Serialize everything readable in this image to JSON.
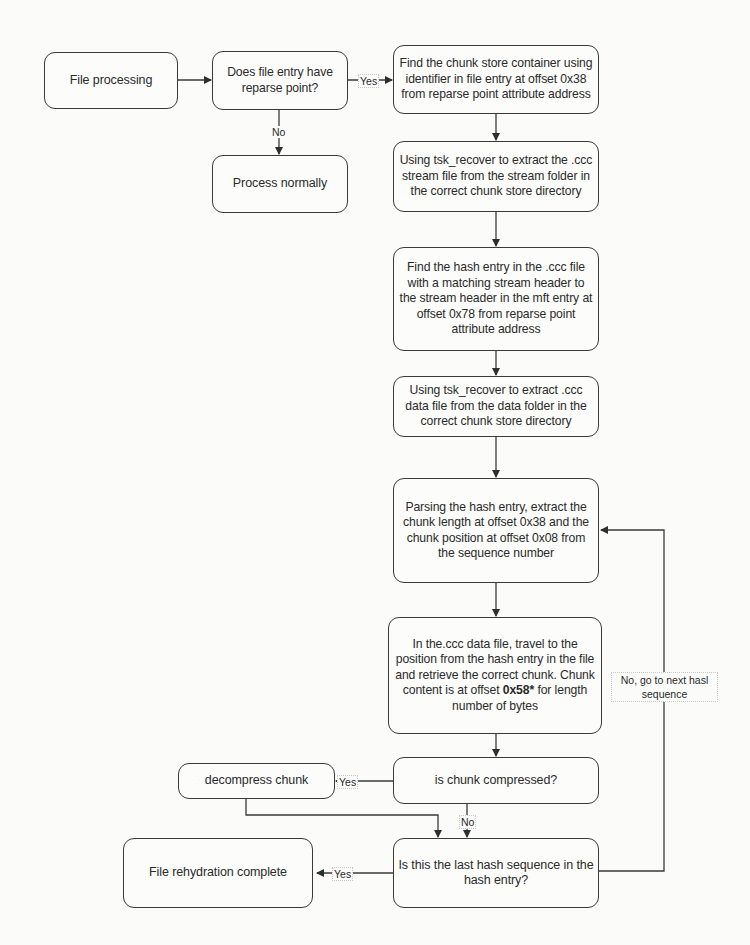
{
  "diagram": {
    "type": "flowchart",
    "nodes": {
      "file_processing": {
        "text": "File processing"
      },
      "has_reparse": {
        "text": "Does file entry have reparse point?"
      },
      "process_normally": {
        "text": "Process normally"
      },
      "find_chunk_store": {
        "text": "Find the chunk store container using identifier in file entry at offset 0x38 from reparse point attribute address"
      },
      "extract_stream": {
        "text": "Using tsk_recover to extract  the .ccc stream file from the stream folder in the correct chunk store directory"
      },
      "find_hash_entry": {
        "text": "Find the hash entry in the .ccc file with a matching stream header to the stream header in the mft entry at offset 0x78 from reparse point attribute address"
      },
      "extract_data": {
        "text": "Using tsk_recover to extract .ccc data file from the data folder in the correct chunk store directory"
      },
      "parse_hash": {
        "text": "Parsing the hash entry, extract the chunk length at offset 0x38 and the chunk position at offset 0x08 from the sequence number"
      },
      "retrieve_chunk": {
        "text_before": "In the.ccc data file, travel to the position from the hash entry in the file and retrieve the correct chunk. Chunk content is at offset ",
        "text_bold": "0x58*",
        "text_after": " for length number of bytes"
      },
      "is_compressed": {
        "text": "is chunk compressed?"
      },
      "decompress": {
        "text": "decompress chunk"
      },
      "is_last": {
        "text": "Is this the last hash sequence in the hash entry?"
      },
      "complete": {
        "text": "File rehydration complete"
      }
    },
    "edge_labels": {
      "reparse_yes": "Yes",
      "reparse_no": "No",
      "compressed_yes": "Yes",
      "compressed_no": "No",
      "last_yes": "Yes",
      "last_no": "No, go to next hasl sequence"
    },
    "colors": {
      "stroke": "#3a3a3a",
      "background": "#fbfbfa",
      "text": "#2a2a2a"
    }
  }
}
